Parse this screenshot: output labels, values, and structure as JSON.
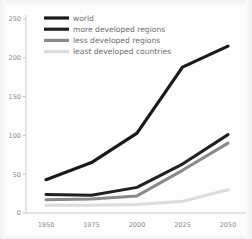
{
  "chart_data": {
    "type": "line",
    "title": "",
    "xlabel": "",
    "ylabel": "",
    "x": [
      1950,
      1975,
      2000,
      2025,
      2050
    ],
    "xtick_labels": [
      "1950",
      "1975",
      "2000",
      "2025",
      "2050"
    ],
    "ytick_labels": [
      "0",
      "50",
      "100",
      "150",
      "200",
      "250"
    ],
    "yticks": [
      0,
      50,
      100,
      150,
      200,
      250
    ],
    "ylim": [
      0,
      250
    ],
    "xlim": [
      1950,
      2050
    ],
    "grid": false,
    "legend_position": "top-left",
    "series": [
      {
        "name": "world",
        "color": "#1a1a1a",
        "width": 3.2,
        "values": [
          43,
          65,
          103,
          188,
          215
        ]
      },
      {
        "name": "more developed regions",
        "color": "#202020",
        "width": 3.0,
        "values": [
          24,
          23,
          33,
          63,
          101
        ]
      },
      {
        "name": "less developed regions",
        "color": "#8a8a8a",
        "width": 3.0,
        "values": [
          17,
          18,
          22,
          55,
          90
        ]
      },
      {
        "name": "least developed countries",
        "color": "#dcdcdc",
        "width": 3.0,
        "values": [
          10,
          10,
          11,
          15,
          30
        ]
      }
    ]
  },
  "legend": {
    "entries": [
      {
        "label": "world",
        "color": "#1a1a1a"
      },
      {
        "label": "more developed regions",
        "color": "#202020"
      },
      {
        "label": "less developed regions",
        "color": "#8a8a8a"
      },
      {
        "label": "least developed countries",
        "color": "#dcdcdc"
      }
    ]
  },
  "axis_color": "#c9c9c9",
  "tick_text_color": "#8b8b8b"
}
